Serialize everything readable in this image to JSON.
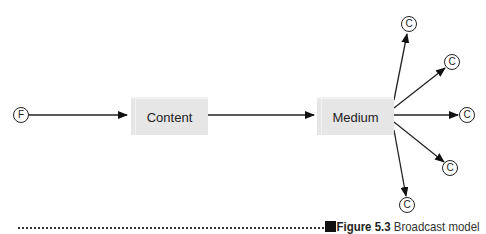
{
  "diagram": {
    "source_node": {
      "label": "F"
    },
    "boxes": [
      {
        "id": "content",
        "label": "Content"
      },
      {
        "id": "medium",
        "label": "Medium"
      }
    ],
    "consumer_nodes": [
      {
        "label": "C"
      },
      {
        "label": "C"
      },
      {
        "label": "C"
      },
      {
        "label": "C"
      },
      {
        "label": "C"
      }
    ],
    "edges": [
      {
        "from": "F",
        "to": "Content"
      },
      {
        "from": "Content",
        "to": "Medium"
      },
      {
        "from": "Medium",
        "to": "C1"
      },
      {
        "from": "Medium",
        "to": "C2"
      },
      {
        "from": "Medium",
        "to": "C3"
      },
      {
        "from": "Medium",
        "to": "C4"
      },
      {
        "from": "Medium",
        "to": "C5"
      }
    ]
  },
  "caption": {
    "figure_number": "Figure 5.3",
    "title": "Broadcast model"
  }
}
